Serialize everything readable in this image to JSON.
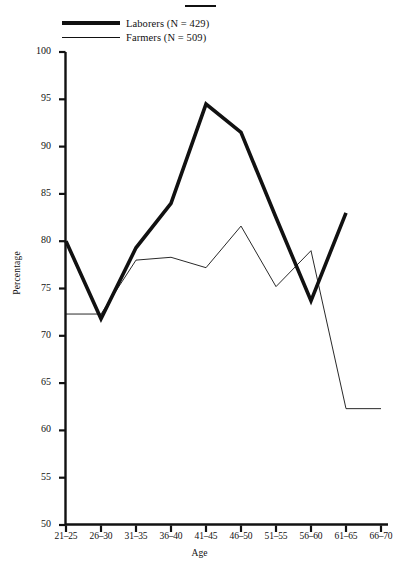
{
  "chart_data": {
    "type": "line",
    "title": "",
    "xlabel": "Age",
    "ylabel": "Percentage",
    "categories": [
      "21-25",
      "26-30",
      "31-35",
      "36-40",
      "41-45",
      "46-50",
      "51-55",
      "56-60",
      "61-65",
      "66-70"
    ],
    "ylim": [
      50,
      100
    ],
    "yticks": [
      50,
      55,
      60,
      65,
      70,
      75,
      80,
      85,
      90,
      95,
      100
    ],
    "grid": false,
    "legend_position": "top-left",
    "series": [
      {
        "name": "Laborers (N = 429)",
        "short_name": "Laborers",
        "n": 429,
        "style": "thick",
        "color": "#111111",
        "values": [
          80.0,
          71.8,
          79.3,
          84.0,
          94.5,
          91.5,
          82.5,
          73.7,
          83.0,
          null
        ]
      },
      {
        "name": "Farmers (N = 509)",
        "short_name": "Farmers",
        "n": 509,
        "style": "thin",
        "color": "#111111",
        "values": [
          72.3,
          72.3,
          78.0,
          78.3,
          77.2,
          81.6,
          75.2,
          79.0,
          62.3,
          62.3
        ]
      }
    ]
  },
  "legend": {
    "items": [
      {
        "label": "Laborers (N = 429)",
        "style": "thick"
      },
      {
        "label": "Farmers (N = 509)",
        "style": "thin"
      }
    ]
  },
  "axes": {
    "y_title": "Percentage",
    "x_title": "Age",
    "y_tick_labels": [
      "100",
      "95",
      "90",
      "85",
      "80",
      "75",
      "70",
      "65",
      "60",
      "55",
      "50"
    ],
    "x_tick_labels": [
      "21-25",
      "26-30",
      "31-35",
      "36-40",
      "41-45",
      "46-50",
      "51-55",
      "56-60",
      "61-65",
      "66-70"
    ]
  }
}
